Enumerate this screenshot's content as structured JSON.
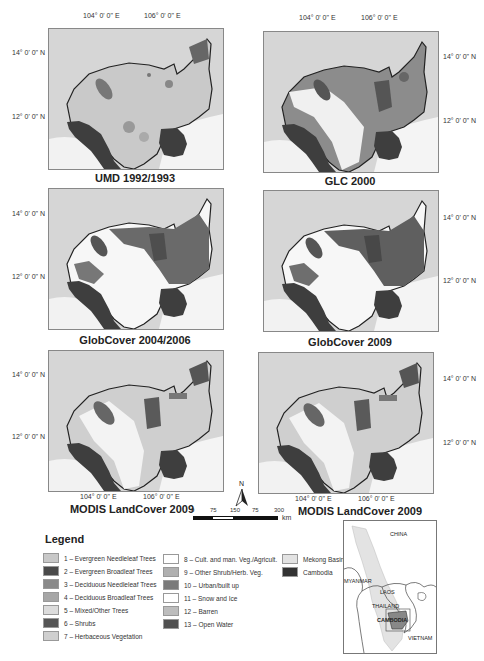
{
  "coords": {
    "lon_104": "104° 0' 0\" E",
    "lon_106": "106° 0' 0\" E",
    "lat_14": "14° 0' 0\" N",
    "lat_12": "12° 0' 0\" N"
  },
  "maps": [
    {
      "title": "UMD 1992/1993",
      "style": "umd"
    },
    {
      "title": "GLC 2000",
      "style": "glc"
    },
    {
      "title": "GlobCover 2004/2006",
      "style": "gc06"
    },
    {
      "title": "GlobCover 2009",
      "style": "gc09"
    },
    {
      "title": "MODIS LandCover 2009",
      "style": "modis"
    },
    {
      "title": "MODIS LandCover 2009",
      "style": "modis"
    }
  ],
  "scale_bar": {
    "labels": [
      "0",
      "75",
      "150",
      "75",
      "300"
    ],
    "unit": "km",
    "north_label": "N"
  },
  "legend": {
    "title": "Legend",
    "classes": [
      {
        "label": "1 – Evergreen Needleleaf Trees",
        "color": "#c8c8c8"
      },
      {
        "label": "2 – Evergreen Broadleaf Trees",
        "color": "#4a4a4a"
      },
      {
        "label": "3 – Deciduous Needleleaf Trees",
        "color": "#8a8a8a"
      },
      {
        "label": "4 – Deciduous Broadleaf Trees",
        "color": "#a6a6a6"
      },
      {
        "label": "5 – Mixed/Other Trees",
        "color": "#dcdcdc"
      },
      {
        "label": "6 – Shrubs",
        "color": "#555555"
      },
      {
        "label": "7 – Herbaceous Vegetation",
        "color": "#cfcfcf"
      },
      {
        "label": "8 – Cult. and man. Veg./Agricult.",
        "color": "#ffffff"
      },
      {
        "label": "9 – Other Shrub/Herb. Veg.",
        "color": "#b0b0b0"
      },
      {
        "label": "10 – Urban/built up",
        "color": "#7a7a7a"
      },
      {
        "label": "11 – Snow and Ice",
        "color": "#ffffff"
      },
      {
        "label": "12 – Barren",
        "color": "#bdbdbd"
      },
      {
        "label": "13 – Open Water",
        "color": "#505050"
      }
    ],
    "extras": [
      {
        "label": "Mekong Basin",
        "color": "#e3e3e3"
      },
      {
        "label": "Cambodia",
        "color": "#333333"
      }
    ]
  },
  "inset": {
    "labels": {
      "china": "CHINA",
      "myanmar": "MYANMAR",
      "laos": "LAOS",
      "thailand": "THAILAND",
      "cambodia": "CAMBODIA",
      "vietnam": "VIETNAM"
    }
  }
}
